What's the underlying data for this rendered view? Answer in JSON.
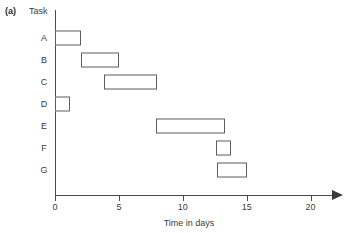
{
  "figure": {
    "panel_label": "(a)"
  },
  "chart_data": {
    "type": "bar",
    "orientation": "horizontal",
    "subtype": "gantt",
    "title": "",
    "xlabel": "Time in days",
    "ylabel": "Task",
    "xlim": [
      0,
      22
    ],
    "ylim_categories": [
      "A",
      "B",
      "C",
      "D",
      "E",
      "F",
      "G"
    ],
    "xticks": [
      0,
      5,
      10,
      15,
      20
    ],
    "xtick_labels": [
      "0",
      "5",
      "10",
      "15",
      "20"
    ],
    "grid": false,
    "legend": null,
    "axis_arrow_x": true,
    "colors": {
      "bar_fill": "#ffffff",
      "bar_edge": "#5d5d5d",
      "axis": "#4a4a4a",
      "text": "#3b3b3b"
    },
    "categories": [
      "A",
      "B",
      "C",
      "D",
      "E",
      "F",
      "G"
    ],
    "tasks": [
      {
        "label": "A",
        "start": 0,
        "end": 2,
        "duration": 2
      },
      {
        "label": "B",
        "start": 2,
        "end": 5,
        "duration": 3
      },
      {
        "label": "C",
        "start": 3.8,
        "end": 8,
        "duration": 4.2
      },
      {
        "label": "D",
        "start": 0,
        "end": 1.2,
        "duration": 1.2
      },
      {
        "label": "E",
        "start": 7.9,
        "end": 13.3,
        "duration": 5.4
      },
      {
        "label": "F",
        "start": 12.6,
        "end": 13.8,
        "duration": 1.2
      },
      {
        "label": "G",
        "start": 12.7,
        "end": 15,
        "duration": 2.3
      }
    ]
  }
}
